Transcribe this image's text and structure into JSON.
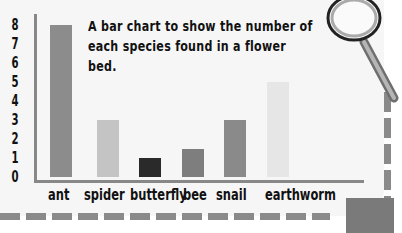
{
  "chart_data": {
    "type": "bar",
    "title": "A bar chart to show the number of each species found in a flower bed.",
    "categories": [
      "ant",
      "spider",
      "butterfly",
      "bee",
      "snail",
      "earthworm"
    ],
    "values": [
      8,
      3,
      1,
      1.5,
      3,
      5
    ],
    "colors": [
      "#8c8c8c",
      "#c4c4c4",
      "#2a2a2a",
      "#7e7e7e",
      "#8a8a8a",
      "#e6e6e6"
    ],
    "xlabel": "",
    "ylabel": "",
    "yticks": [
      "0",
      "1",
      "2",
      "3",
      "4",
      "5",
      "6",
      "7",
      "8"
    ],
    "ylim": [
      0,
      8
    ],
    "grid": false,
    "legend": false
  }
}
